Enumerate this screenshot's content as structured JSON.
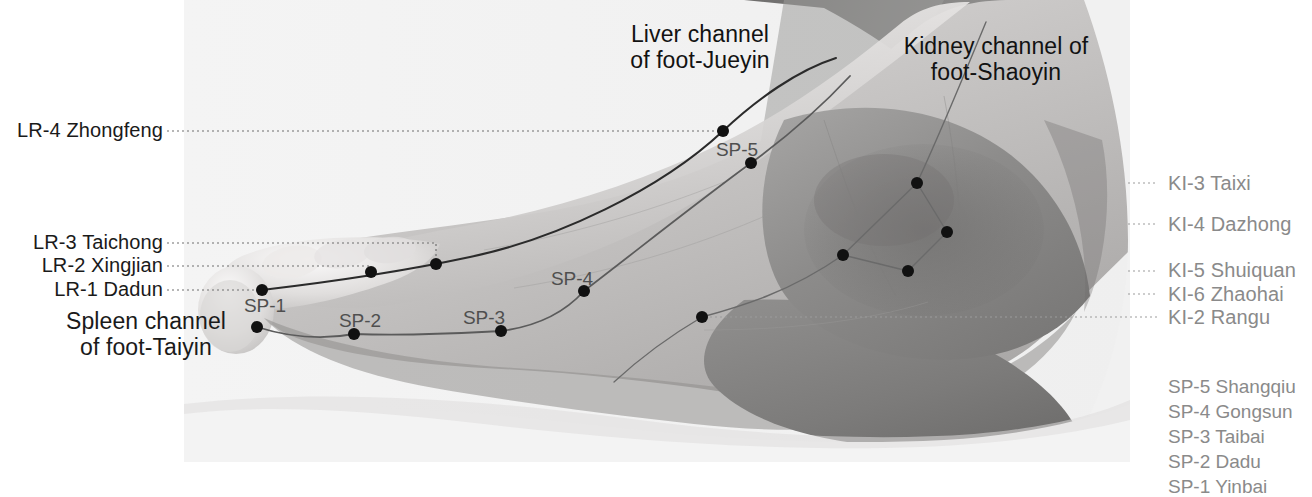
{
  "figure": {
    "background_color": "#ffffff",
    "plate_color": "#f2f2f2",
    "point_color": "#111111",
    "label_color": "#1a1a1a",
    "muted_label_color": "#8a8a8a",
    "point_label_color": "#4f4f4f"
  },
  "channel_titles": [
    {
      "id": "liver-channel-title",
      "line1": "Liver channel",
      "line2": "of foot-Jueyin",
      "x": 700,
      "y": 24
    },
    {
      "id": "kidney-channel-title",
      "line1": "Kidney channel of",
      "line2": "foot-Shaoyin",
      "x": 996,
      "y": 36
    },
    {
      "id": "spleen-channel-title",
      "line1": "Spleen channel",
      "line2": "of foot-Taiyin",
      "x": 146,
      "y": 311
    }
  ],
  "left_labels": [
    {
      "id": "lr-4",
      "text": "LR-4 Zhongfeng",
      "x": 163,
      "y": 119,
      "leader_y": 131,
      "leader_x_end": 723,
      "drop_to_y": 131
    },
    {
      "id": "lr-3",
      "text": "LR-3 Taichong",
      "x": 163,
      "y": 231,
      "leader_y": 243,
      "leader_x_end": 436,
      "drop_to_y": 264
    },
    {
      "id": "lr-2",
      "text": "LR-2 Xingjian",
      "x": 163,
      "y": 254,
      "leader_y": 266,
      "leader_x_end": 371,
      "drop_to_y": 272
    },
    {
      "id": "lr-1",
      "text": "LR-1 Dadun",
      "x": 163,
      "y": 278,
      "leader_y": 290,
      "leader_x_end": 262,
      "drop_to_y": 290
    }
  ],
  "right_labels": [
    {
      "id": "ki-3",
      "text": "KI-3 Taixi",
      "x": 1168,
      "y": 172,
      "leader_y": 183,
      "leader_x_start": 1128
    },
    {
      "id": "ki-4",
      "text": "KI-4 Dazhong",
      "x": 1168,
      "y": 213,
      "leader_y": 224,
      "leader_x_start": 1128
    },
    {
      "id": "ki-5",
      "text": "KI-5 Shuiquan",
      "x": 1168,
      "y": 259,
      "leader_y": 271,
      "leader_x_start": 1128
    },
    {
      "id": "ki-6",
      "text": "KI-6 Zhaohai",
      "x": 1168,
      "y": 283,
      "leader_y": 294,
      "leader_x_start": 1128
    },
    {
      "id": "ki-2",
      "text": "KI-2 Rangu",
      "x": 1168,
      "y": 306,
      "leader_y": 317,
      "leader_x_start": 700
    }
  ],
  "legend": {
    "x": 1168,
    "y": 374,
    "items": [
      "SP-5 Shangqiu",
      "SP-4 Gongsun",
      "SP-3 Taibai",
      "SP-2 Dadu",
      "SP-1 Yinbai"
    ]
  },
  "point_labels": [
    {
      "id": "sp-1-label",
      "text": "SP-1",
      "x": 265,
      "y": 306
    },
    {
      "id": "sp-2-label",
      "text": "SP-2",
      "x": 360,
      "y": 321
    },
    {
      "id": "sp-3-label",
      "text": "SP-3",
      "x": 484,
      "y": 318
    },
    {
      "id": "sp-4-label",
      "text": "SP-4",
      "x": 572,
      "y": 279
    },
    {
      "id": "sp-5-label",
      "text": "SP-5",
      "x": 737,
      "y": 150
    }
  ],
  "points": [
    {
      "id": "lr-1-point",
      "label": "LR-1 Dadun",
      "x": 262,
      "y": 290,
      "r": 6
    },
    {
      "id": "lr-2-point",
      "label": "LR-2 Xingjian",
      "x": 371,
      "y": 272,
      "r": 6
    },
    {
      "id": "lr-3-point",
      "label": "LR-3 Taichong",
      "x": 436,
      "y": 264,
      "r": 6
    },
    {
      "id": "lr-4-point",
      "label": "LR-4 Zhongfeng",
      "x": 723,
      "y": 131,
      "r": 6
    },
    {
      "id": "sp-1-point",
      "label": "SP-1 Yinbai",
      "x": 257,
      "y": 327,
      "r": 6
    },
    {
      "id": "sp-2-point",
      "label": "SP-2 Dadu",
      "x": 354,
      "y": 334,
      "r": 6
    },
    {
      "id": "sp-3-point",
      "label": "SP-3 Taibai",
      "x": 501,
      "y": 331,
      "r": 6
    },
    {
      "id": "sp-4-point",
      "label": "SP-4 Gongsun",
      "x": 584,
      "y": 291,
      "r": 6
    },
    {
      "id": "sp-5-point",
      "label": "SP-5 Shangqiu",
      "x": 751,
      "y": 163,
      "r": 6
    },
    {
      "id": "ki-2-point",
      "label": "KI-2 Rangu",
      "x": 702,
      "y": 317,
      "r": 6
    },
    {
      "id": "ki-3-point",
      "label": "KI-3 Taixi",
      "x": 917,
      "y": 183,
      "r": 6
    },
    {
      "id": "ki-4-point",
      "label": "KI-4 Dazhong",
      "x": 947,
      "y": 232,
      "r": 6
    },
    {
      "id": "ki-5-point",
      "label": "KI-5 Shuiquan",
      "x": 908,
      "y": 271,
      "r": 6
    },
    {
      "id": "ki-6-point",
      "label": "KI-6 Zhaohai",
      "x": 843,
      "y": 255,
      "r": 6
    }
  ],
  "channel_paths": {
    "liver": "M262,290 C330,281 400,271 470,257 C560,238 660,190 723,131 C760,96 800,68 838,58",
    "spleen": "M257,327 C300,337 330,338 354,334 C430,336 460,333 501,331 C540,326 565,310 584,291 C640,248 700,200 751,163 C790,134 820,108 845,86",
    "kidney_upper": "M702,317 C760,300 800,285 843,255 L917,183 L947,232 L908,271 L843,255",
    "kidney_lower": "M702,317 C660,340 630,360 600,380",
    "kidney_leg": "M917,183 C940,140 960,90 985,20"
  }
}
